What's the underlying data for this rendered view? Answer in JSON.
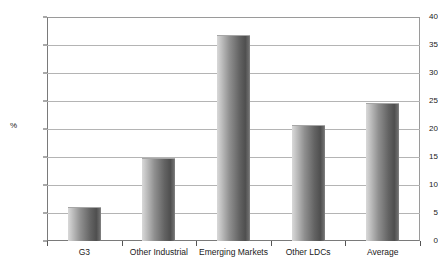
{
  "chart_data": {
    "type": "bar",
    "title": "",
    "xlabel": "",
    "ylabel": "%",
    "categories": [
      "G3",
      "Other Industrial",
      "Emerging Markets",
      "Other LDCs",
      "Average"
    ],
    "values": [
      6.0,
      14.8,
      36.8,
      20.7,
      24.7
    ],
    "ylim": [
      0,
      40
    ],
    "ytick_labels": [
      "0",
      "5",
      "10",
      "15",
      "20",
      "25",
      "30",
      "35",
      "40"
    ],
    "ytick_values": [
      0,
      5,
      10,
      15,
      20,
      25,
      30,
      35,
      40
    ],
    "grid": true,
    "legend": false,
    "legend_position": "none",
    "bar_color": "#6e6e6e",
    "bar_style": "cylinder-gradient-grayscale",
    "background_color": "#ffffff",
    "gridline_color": "#b4b4b4",
    "axis_color": "#555555",
    "text_color": "#1a1a1a"
  }
}
